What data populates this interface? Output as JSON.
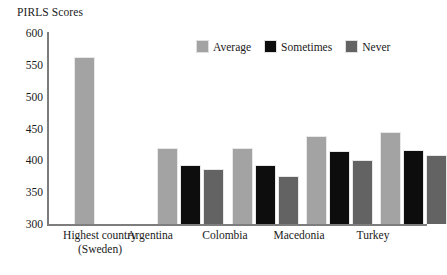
{
  "chart_data": {
    "type": "bar",
    "title": "PIRLS Scores",
    "xlabel": "",
    "ylabel": "PIRLS Scores",
    "ylim": [
      300,
      600
    ],
    "yticks": [
      600,
      550,
      500,
      450,
      400,
      350,
      300
    ],
    "grid": false,
    "legend_position": "top-center",
    "categories": [
      "Highest country\n(Sweden)",
      "Argentina",
      "Colombia",
      "Macedonia",
      "Turkey"
    ],
    "series": [
      {
        "name": "Average",
        "color": "#a3a3a3",
        "values": [
          563,
          420,
          420,
          438,
          444
        ]
      },
      {
        "name": "Sometimes",
        "color": "#0d0d0d",
        "values": [
          null,
          392,
          392,
          415,
          417
        ]
      },
      {
        "name": "Never",
        "color": "#636363",
        "values": [
          null,
          386,
          376,
          401,
          409
        ]
      }
    ]
  },
  "axis": {
    "line_color": "#7d7d7d"
  }
}
